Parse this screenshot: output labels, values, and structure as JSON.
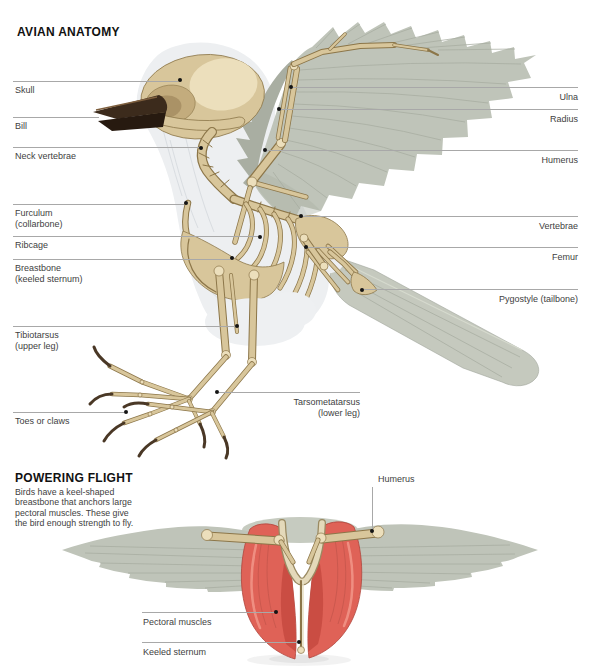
{
  "anatomy": {
    "title": "AVIAN ANATOMY",
    "labels": {
      "skull": "Skull",
      "bill": "Bill",
      "neck_vertebrae": "Neck vertebrae",
      "furculum": "Furculum\n(collarbone)",
      "ribcage": "Ribcage",
      "breastbone": "Breastbone\n(keeled sternum)",
      "tibiotarsus": "Tibiotarsus\n(upper leg)",
      "toes": "Toes or claws",
      "ulna": "Ulna",
      "radius": "Radius",
      "humerus": "Humerus",
      "vertebrae": "Vertebrae",
      "femur": "Femur",
      "pygostyle": "Pygostyle (tailbone)",
      "tarsometatarsus": "Tarsometatarsus\n(lower leg)"
    }
  },
  "flight": {
    "title": "POWERING FLIGHT",
    "description": "Birds have a keel-shaped\nbreastbone that anchors large\npectoral muscles. These give\nthe bird enough strength to fly.",
    "labels": {
      "humerus": "Humerus",
      "pectoral_muscles": "Pectoral muscles",
      "keeled_sternum": "Keeled sternum"
    }
  },
  "colors": {
    "background": "#ffffff",
    "title_text": "#111111",
    "label_text": "#414141",
    "leader_line": "#a8a8a8",
    "leader_dot": "#141414",
    "bone": "#d8c69b",
    "bone_light": "#ecdfbc",
    "bone_outline": "#8c7649",
    "bill": "#3c2b1c",
    "body": "#edeff1",
    "wing": "#bfc4b9",
    "wing_shadow": "#a9aea2",
    "tail": "#c5c9be",
    "muscle": "#df6257",
    "muscle_shadow": "#c4493f"
  }
}
